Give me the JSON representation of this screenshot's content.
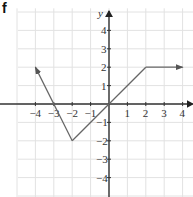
{
  "panel_label": "f",
  "axes": {
    "x_label": "x",
    "y_label": "y",
    "x_ticks": [
      "−4",
      "−3",
      "−2",
      "−1",
      "1",
      "2",
      "3",
      "4"
    ],
    "y_ticks": [
      "4",
      "3",
      "2",
      "1",
      "−1",
      "−2",
      "−3",
      "−4"
    ],
    "x_range": [
      -5,
      5
    ],
    "y_range": [
      -5,
      5
    ]
  },
  "function_graph": {
    "description": "Piecewise linear graph",
    "points": [
      [
        -4,
        2
      ],
      [
        -2,
        -2
      ],
      [
        2,
        2
      ],
      [
        4,
        2
      ]
    ],
    "left_end": "arrow",
    "right_end": "arrow",
    "color": "#666666"
  },
  "colors": {
    "grid": "#e2e2e2",
    "axis": "#333333",
    "line": "#666666"
  }
}
